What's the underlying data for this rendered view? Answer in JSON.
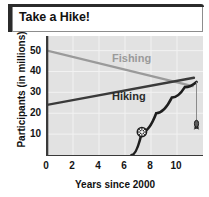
{
  "figure": {
    "title": "Take a Hike!"
  },
  "chart_data": {
    "type": "line",
    "title": "Take a Hike!",
    "xlabel": "Years since 2000",
    "ylabel": "Participants (in millions)",
    "xlim": [
      0,
      12
    ],
    "ylim": [
      0,
      57
    ],
    "xticks": [
      "0",
      "2",
      "4",
      "6",
      "8",
      "10"
    ],
    "xtick_values": [
      0,
      2,
      4,
      6,
      8,
      10
    ],
    "yticks": [
      "10",
      "20",
      "30",
      "40",
      "50"
    ],
    "ytick_values": [
      10,
      20,
      30,
      40,
      50
    ],
    "grid": true,
    "legend": "inline-labels",
    "background": "#e2e2e2",
    "series": [
      {
        "name": "Fishing",
        "color": "#9a9a9a",
        "label_color": "#9a9a9a",
        "label_x": 5.0,
        "label_y": 44.5,
        "x": [
          0,
          11.2
        ],
        "values": [
          50,
          33
        ]
      },
      {
        "name": "Hiking",
        "color": "#3a3a3a",
        "label_color": "#2b2b2b",
        "label_x": 5.0,
        "label_y": 26.5,
        "x": [
          0,
          11.3
        ],
        "values": [
          24,
          37
        ]
      }
    ],
    "annotations": [
      {
        "name": "fishing-rod-curve",
        "type": "curve",
        "color": "#1e1e1e",
        "points": [
          [
            6.5,
            0
          ],
          [
            7.3,
            11
          ],
          [
            8.4,
            20
          ],
          [
            9.6,
            27.5
          ],
          [
            10.6,
            32.5
          ],
          [
            11.5,
            35
          ]
        ]
      },
      {
        "name": "compass-marker",
        "type": "marker-circle",
        "x": 7.3,
        "y": 11
      },
      {
        "name": "drop-line",
        "type": "vertical-line",
        "x": 11.5,
        "y_top": 35,
        "y_bottom": 13
      },
      {
        "name": "lure-marker",
        "type": "marker-lure",
        "x": 11.5,
        "y": 15
      }
    ]
  }
}
